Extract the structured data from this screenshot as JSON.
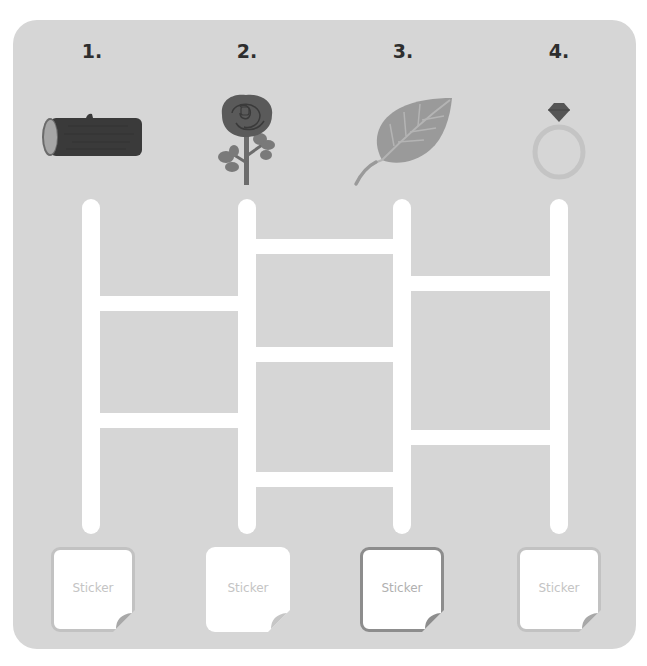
{
  "board": {
    "background_color": "#d6d6d6",
    "path_color": "#ffffff"
  },
  "columns": [
    {
      "number": "1.",
      "item": "log",
      "icon": "log-icon",
      "center_x": 91
    },
    {
      "number": "2.",
      "item": "rose",
      "icon": "rose-icon",
      "center_x": 247
    },
    {
      "number": "3.",
      "item": "leaf",
      "icon": "leaf-icon",
      "center_x": 402
    },
    {
      "number": "4.",
      "item": "ring",
      "icon": "ring-icon",
      "center_x": 559
    }
  ],
  "ladder": {
    "rail_top": 199,
    "rail_bottom": 534,
    "rungs": [
      {
        "between": [
          1,
          2
        ],
        "y": 303
      },
      {
        "between": [
          1,
          2
        ],
        "y": 420
      },
      {
        "between": [
          2,
          3
        ],
        "y": 246
      },
      {
        "between": [
          2,
          3
        ],
        "y": 354
      },
      {
        "between": [
          2,
          3
        ],
        "y": 480
      },
      {
        "between": [
          3,
          4
        ],
        "y": 283
      },
      {
        "between": [
          3,
          4
        ],
        "y": 437
      }
    ]
  },
  "stickers": [
    {
      "label": "Sticker",
      "border": "light"
    },
    {
      "label": "Sticker",
      "border": "none"
    },
    {
      "label": "Sticker",
      "border": "dark"
    },
    {
      "label": "Sticker",
      "border": "light"
    }
  ]
}
